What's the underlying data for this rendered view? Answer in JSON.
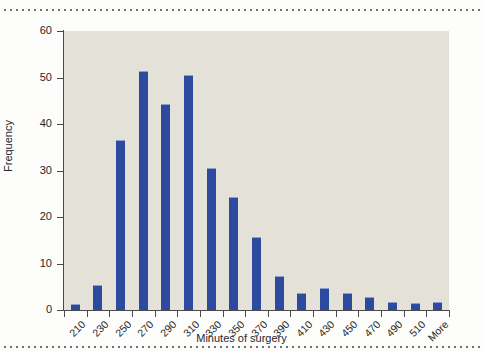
{
  "figure": {
    "background_color": "#fdfdfb",
    "plot_background_color": "#e4e1d8",
    "bar_color": "#2d4b9e",
    "axis_color": "#4a4a4a",
    "rule_top_name": "dotted-rule-top",
    "rule_bottom_name": "dotted-rule-bottom"
  },
  "chart_data": {
    "type": "bar",
    "title": "",
    "xlabel": "Minutes of surgery",
    "ylabel": "Frequency",
    "categories": [
      "210",
      "230",
      "250",
      "270",
      "290",
      "310",
      "330",
      "350",
      "370",
      "390",
      "410",
      "430",
      "450",
      "470",
      "490",
      "510",
      "More"
    ],
    "values": [
      1.2,
      5.3,
      36.6,
      51.4,
      44.2,
      50.6,
      30.6,
      24.3,
      15.6,
      7.4,
      3.6,
      4.7,
      3.6,
      2.7,
      1.7,
      1.6,
      1.7
    ],
    "ylim": [
      0,
      60
    ],
    "yticks": [
      0,
      10,
      20,
      30,
      40,
      50,
      60
    ],
    "ytick_labels": [
      "0",
      "10",
      "20",
      "30",
      "40",
      "50",
      "60"
    ],
    "grid": false,
    "legend": null,
    "legend_position": "none"
  }
}
